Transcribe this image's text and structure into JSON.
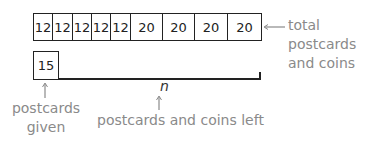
{
  "top_bar": {
    "cells": [
      {
        "value": "12",
        "width": 19
      },
      {
        "value": "12",
        "width": 20
      },
      {
        "value": "12",
        "width": 19
      },
      {
        "value": "12",
        "width": 19
      },
      {
        "value": "12",
        "width": 20
      },
      {
        "value": "20",
        "width": 32
      },
      {
        "value": "20",
        "width": 32
      },
      {
        "value": "20",
        "width": 33
      },
      {
        "value": "20",
        "width": 33
      }
    ],
    "label_line1": "total postcards",
    "label_line2": "and coins"
  },
  "bottom_bar": {
    "given_value": "15",
    "given_label_line1": "postcards",
    "given_label_line2": "given away",
    "unknown_symbol": "n",
    "unknown_label": "postcards and coins left"
  },
  "colors": {
    "stroke": "#222222",
    "label": "#8a8a8a"
  }
}
